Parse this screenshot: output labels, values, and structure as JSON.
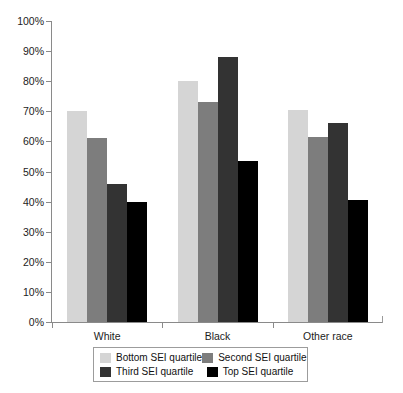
{
  "chart_data": {
    "type": "bar",
    "title": "",
    "xlabel": "",
    "ylabel": "",
    "ylim": [
      0,
      100
    ],
    "y_unit": "%",
    "grid": false,
    "legend_position": "bottom",
    "categories": [
      "White",
      "Black",
      "Other race"
    ],
    "ytick_labels": [
      "0%",
      "10%",
      "20%",
      "30%",
      "40%",
      "50%",
      "60%",
      "70%",
      "80%",
      "90%",
      "100%"
    ],
    "ytick_values": [
      0,
      10,
      20,
      30,
      40,
      50,
      60,
      70,
      80,
      90,
      100
    ],
    "series": [
      {
        "name": "Bottom SEI quartile",
        "color": "#d5d5d5",
        "values": [
          70,
          80,
          70.5
        ]
      },
      {
        "name": "Second SEI quartile",
        "color": "#7d7d7d",
        "values": [
          61,
          73,
          61.5
        ]
      },
      {
        "name": "Third SEI quartile",
        "color": "#333333",
        "values": [
          46,
          88,
          66
        ]
      },
      {
        "name": "Top SEI quartile",
        "color": "#000000",
        "values": [
          40,
          53.5,
          40.5
        ]
      }
    ]
  },
  "legend": {
    "items": [
      {
        "label": "Bottom SEI quartile",
        "color": "#d5d5d5"
      },
      {
        "label": "Second SEI quartile",
        "color": "#7d7d7d"
      },
      {
        "label": "Third SEI quartile",
        "color": "#333333"
      },
      {
        "label": "Top SEI quartile",
        "color": "#000000"
      }
    ]
  }
}
